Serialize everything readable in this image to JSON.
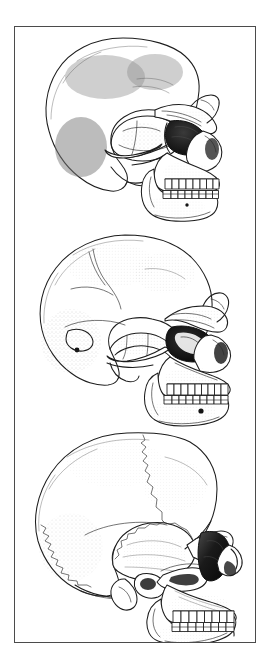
{
  "plate": {
    "title": "Comparative hominid skull plate",
    "medium": "stipple and line illustration",
    "background_color": "#ffffff",
    "ink_color": "#1d1d1d",
    "frame": {
      "border_color": "#4b4b4b",
      "border_width_px": 1,
      "x": 14,
      "y": 26,
      "width": 242,
      "height": 617
    },
    "text_present": false,
    "labels": [],
    "captions": []
  },
  "figures": [
    {
      "index": 1,
      "name": "skull-top",
      "view": "left lateral profile, facing right",
      "position": "top panel",
      "bbox": {
        "x": 29,
        "y": 9,
        "width": 172,
        "height": 158
      },
      "features": [
        "low receding braincase",
        "heavy continuous supraorbital torus",
        "large rounded orbit with dark shading",
        "broad nasal aperture",
        "prognathic midface",
        "deep robust mandible without chin",
        "full arch of upper and lower teeth",
        "prominent zygomatic arch",
        "large rounded temporal/mastoid region"
      ],
      "shading": "dense stipple on temporal and occipital regions",
      "tooth_count_upper": 8,
      "tooth_count_lower": 8
    },
    {
      "index": 2,
      "name": "skull-middle",
      "view": "left lateral profile, facing right",
      "position": "middle panel",
      "bbox": {
        "x": 22,
        "y": 13,
        "width": 190,
        "height": 168
      },
      "features": [
        "long low vault with visible coronal and lambdoid sutures",
        "double-arched brow ridge",
        "squared deep orbit with dark interior",
        "wide nasal opening",
        "projecting maxilla",
        "heavy mandible, weak chin",
        "mental foramen visible",
        "parietal foramen visible",
        "mastoid process"
      ],
      "shading": "fine stipple across occipital and zygomatic areas",
      "tooth_count_upper": 9,
      "tooth_count_lower": 9
    },
    {
      "index": 3,
      "name": "skull-bottom",
      "view": "left lateral profile, facing right",
      "position": "bottom panel",
      "bbox": {
        "x": 18,
        "y": 6,
        "width": 200,
        "height": 200
      },
      "features": [
        "high globular braincase",
        "vertical frontal bone",
        "reduced brow ridge",
        "large teardrop orbit with dark shadow",
        "narrow nasal aperture with nasal bones",
        "orthognathic face",
        "mandible with distinct chin",
        "zygomatic arch and mandibular condyle",
        "serrated lambdoid suture",
        "coronal suture across vault",
        "temporal line"
      ],
      "shading": "soft stipple gradients on parietal, temporal and maxilla",
      "tooth_count_upper": 8,
      "tooth_count_lower": 8
    }
  ],
  "colors": {
    "ink": "#1d1d1d",
    "frame": "#4b4b4b",
    "paper": "#ffffff",
    "shadow": "#151515",
    "midtone": "#6e6e6e"
  }
}
